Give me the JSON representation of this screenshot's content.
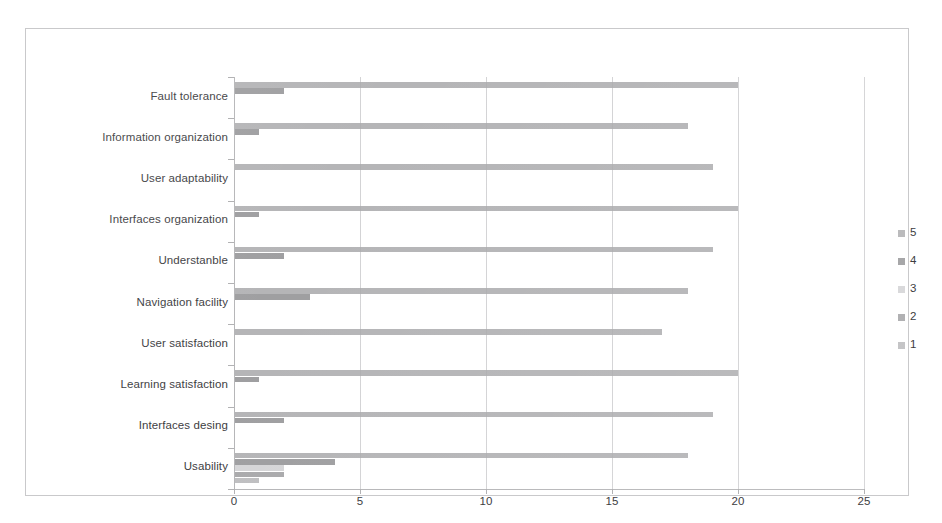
{
  "chart_data": {
    "type": "bar",
    "orientation": "horizontal",
    "title": "",
    "xlabel": "",
    "ylabel": "",
    "xlim": [
      0,
      25
    ],
    "xticks": [
      0,
      5,
      10,
      15,
      20,
      25
    ],
    "xtick_labels": [
      "0",
      "5",
      "10",
      "15",
      "20",
      "25"
    ],
    "grid": true,
    "legend_position": "right",
    "legend_entries": [
      "5",
      "4",
      "3",
      "2",
      "1"
    ],
    "categories": [
      "Fault tolerance",
      "Information organization",
      "User adaptability",
      "Interfaces organization",
      "Understanble",
      "Navigation facility",
      "User satisfaction",
      "Learning satisfaction",
      "Interfaces desing",
      "Usability"
    ],
    "series": [
      {
        "name": "5",
        "color": "#a8a8aa",
        "values": [
          20,
          18,
          19,
          20,
          19,
          18,
          17,
          20,
          19,
          18
        ]
      },
      {
        "name": "4",
        "color": "#8e8e90",
        "values": [
          2,
          1,
          0,
          1,
          2,
          3,
          0,
          1,
          2,
          4
        ]
      },
      {
        "name": "3",
        "color": "#cfcfd1",
        "values": [
          0,
          0,
          0,
          0,
          0,
          0,
          0,
          0,
          0,
          2
        ]
      },
      {
        "name": "2",
        "color": "#9b9b9d",
        "values": [
          0,
          0,
          0,
          0,
          0,
          0,
          0,
          0,
          0,
          2
        ]
      },
      {
        "name": "1",
        "color": "#b4b4b6",
        "values": [
          0,
          0,
          0,
          0,
          0,
          0,
          0,
          0,
          0,
          1
        ]
      }
    ]
  },
  "colors": {
    "frame_border": "#c9c9cb",
    "gridline": "#d3d3d5",
    "axis_line": "#b6b6b8",
    "text": "#3d3d3f",
    "background": "#ffffff"
  }
}
